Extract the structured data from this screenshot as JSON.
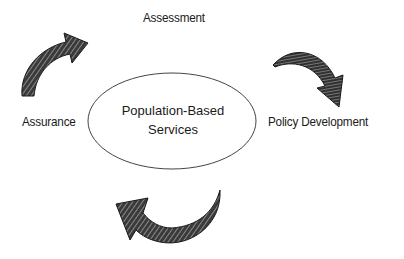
{
  "diagram": {
    "type": "cycle",
    "center": {
      "line1": "Population-Based",
      "line2": "Services"
    },
    "nodes": [
      {
        "id": "assessment",
        "label": "Assessment",
        "position": "top"
      },
      {
        "id": "policy",
        "label": "Policy Development",
        "position": "right"
      },
      {
        "id": "assurance",
        "label": "Assurance",
        "position": "left"
      }
    ],
    "arrows": [
      {
        "from": "assessment",
        "to": "policy",
        "direction": "clockwise"
      },
      {
        "from": "policy",
        "to": "assurance",
        "direction": "clockwise"
      },
      {
        "from": "assurance",
        "to": "assessment",
        "direction": "clockwise"
      }
    ],
    "colors": {
      "stroke": "#333333",
      "arrow_fill": "#2a2a2a",
      "background": "#ffffff"
    }
  }
}
